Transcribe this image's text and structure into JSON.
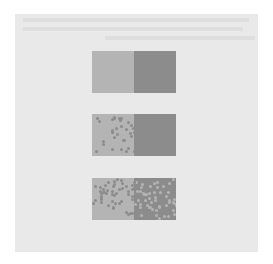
{
  "figure": {
    "background_color": "#ffffff",
    "page_color": "#e9e9e9",
    "light_gray": "#b4b4b4",
    "dark_gray": "#8c8c8c",
    "rows": [
      {
        "name": "hard-edge",
        "type": "sharp",
        "top": 37
      },
      {
        "name": "partial-dither",
        "type": "dither-narrow",
        "top": 100
      },
      {
        "name": "full-dither",
        "type": "dither-wide",
        "top": 164
      }
    ]
  }
}
